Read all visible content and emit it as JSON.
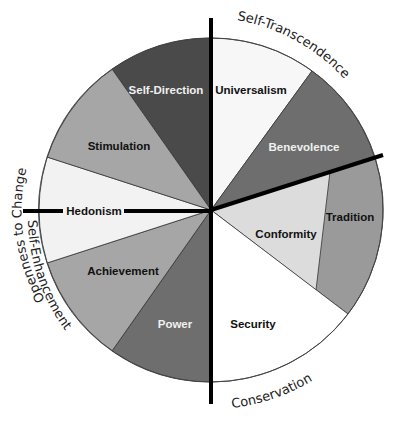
{
  "diagram": {
    "center": [
      211,
      210
    ],
    "radius": 172,
    "segments": [
      {
        "id": "self-direction",
        "label": "Self-Direction",
        "fill": "#4a4a4a",
        "text_color": "#f0f0f0",
        "label_pos": [
          166,
          90
        ]
      },
      {
        "id": "universalism",
        "label": "Universalism",
        "fill": "#f7f7f7",
        "text_color": "#111111",
        "label_pos": [
          250,
          90
        ]
      },
      {
        "id": "benevolence",
        "label": "Benevolence",
        "fill": "#6e6e6e",
        "text_color": "#f0f0f0",
        "label_pos": [
          303,
          147
        ]
      },
      {
        "id": "tradition",
        "label": "Tradition",
        "fill": "#9a9a9a",
        "text_color": "#111111",
        "label_pos": [
          350,
          217
        ]
      },
      {
        "id": "conformity",
        "label": "Conformity",
        "fill": "#dcdcdc",
        "text_color": "#111111",
        "label_pos": [
          279,
          235
        ]
      },
      {
        "id": "security",
        "label": "Security",
        "fill": "#ffffff",
        "text_color": "#111111",
        "label_pos": [
          252,
          324
        ]
      },
      {
        "id": "power",
        "label": "Power",
        "fill": "#6e6e6e",
        "text_color": "#f0f0f0",
        "label_pos": [
          174,
          324
        ]
      },
      {
        "id": "achievement",
        "label": "Achievement",
        "fill": "#a6a6a6",
        "text_color": "#111111",
        "label_pos": [
          122,
          271
        ]
      },
      {
        "id": "hedonism",
        "label": "Hedonism",
        "fill": "#f2f2f2",
        "text_color": "#111111",
        "label_pos": [
          96,
          211
        ]
      },
      {
        "id": "stimulation",
        "label": "Stimulation",
        "fill": "#a6a6a6",
        "text_color": "#111111",
        "label_pos": [
          120,
          146
        ]
      }
    ],
    "groups": [
      {
        "id": "openness",
        "label": "Openness to Change"
      },
      {
        "id": "self-transcendence",
        "label": "Self-Transcendence"
      },
      {
        "id": "self-enhancement",
        "label": "Self-Enhancement"
      },
      {
        "id": "conservation",
        "label": "Conservation"
      }
    ],
    "axis_color": "#000000",
    "outline_color": "#333333"
  }
}
